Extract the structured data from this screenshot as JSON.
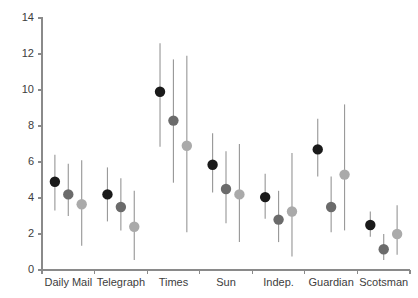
{
  "chart_data": {
    "type": "scatter",
    "title": "",
    "subtitle": "",
    "xlabel": "",
    "ylabel": "",
    "categories": [
      "Daily Mail",
      "Telegraph",
      "Times",
      "Sun",
      "Indep.",
      "Guardian",
      "Scotsman"
    ],
    "ylim": [
      0,
      14
    ],
    "yticks": [
      0,
      2,
      4,
      6,
      8,
      10,
      12,
      14
    ],
    "ytick_labels": [
      "0",
      "2",
      "4",
      "6",
      "8",
      "10",
      "12",
      "14"
    ],
    "grid": false,
    "legend": "none",
    "series": [
      {
        "name": "series-1",
        "color": "#1a1a1a",
        "values": [
          4.9,
          4.2,
          9.9,
          5.85,
          4.05,
          6.7,
          2.5
        ],
        "lower": [
          3.3,
          2.7,
          6.85,
          4.3,
          2.85,
          5.2,
          1.85
        ],
        "upper": [
          6.4,
          5.7,
          12.6,
          7.6,
          5.35,
          8.4,
          3.25
        ]
      },
      {
        "name": "series-2",
        "color": "#6b6b6b",
        "values": [
          4.2,
          3.5,
          8.3,
          4.5,
          2.8,
          3.5,
          1.15
        ],
        "lower": [
          3.0,
          2.2,
          4.85,
          2.6,
          1.55,
          2.1,
          0.55
        ],
        "upper": [
          5.9,
          5.1,
          11.7,
          6.6,
          4.4,
          5.2,
          2.0
        ]
      },
      {
        "name": "series-3",
        "color": "#aaaaaa",
        "values": [
          3.65,
          2.4,
          6.9,
          4.2,
          3.25,
          5.3,
          2.0
        ],
        "lower": [
          1.35,
          0.55,
          2.1,
          1.55,
          0.75,
          2.2,
          0.85
        ],
        "upper": [
          6.1,
          4.4,
          11.9,
          7.0,
          6.5,
          9.2,
          3.6
        ]
      }
    ]
  },
  "axis": {
    "y_label_0": "0",
    "y_label_2": "2",
    "y_label_4": "4",
    "y_label_6": "6",
    "y_label_8": "8",
    "y_label_10": "10",
    "y_label_12": "12",
    "y_label_14": "14"
  }
}
